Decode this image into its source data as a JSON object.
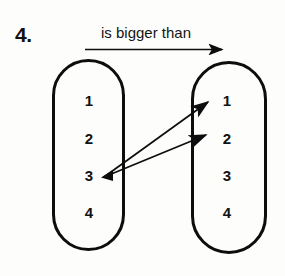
{
  "exercise": {
    "number": "4.",
    "relation_label": "is bigger than",
    "relation_arrow_icon": "right-arrow-icon"
  },
  "domain_set": {
    "name": "left-set",
    "elements": [
      "1",
      "2",
      "3",
      "4"
    ]
  },
  "codomain_set": {
    "name": "right-set",
    "elements": [
      "1",
      "2",
      "3",
      "4"
    ]
  },
  "mappings": [
    {
      "from": "3",
      "to": "1",
      "arrow_icon": "mapping-arrow-icon"
    },
    {
      "from": "3",
      "to": "2",
      "arrow_icon": "mapping-arrow-icon"
    }
  ],
  "colors": {
    "ink": "#0d0d0d",
    "paper": "#fdfdfc"
  }
}
